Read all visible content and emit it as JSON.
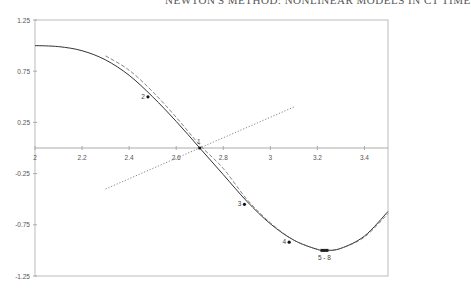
{
  "header": {
    "text": "NEWTON'S METHOD: NONLINEAR MODELS IN CT TIME"
  },
  "chart_data": {
    "type": "line",
    "title": "",
    "xlabel": "",
    "ylabel": "",
    "xlim": [
      2,
      3.5
    ],
    "ylim": [
      -1.25,
      1.25
    ],
    "grid": false,
    "x_ticks": [
      "2",
      "2.2",
      "2.4",
      "2.6",
      "2.8",
      "3",
      "3.2",
      "3.4"
    ],
    "y_ticks": [
      "1.25",
      "0.75",
      "0.25",
      "-0.25",
      "-0.75",
      "-1.25"
    ],
    "series": [
      {
        "name": "function",
        "style": "solid",
        "x": [
          2.0,
          2.1,
          2.2,
          2.3,
          2.4,
          2.5,
          2.6,
          2.7,
          2.8,
          2.9,
          3.0,
          3.1,
          3.2,
          3.24,
          3.3,
          3.4,
          3.5
        ],
        "y": [
          1.0,
          0.99,
          0.95,
          0.86,
          0.71,
          0.5,
          0.26,
          0.0,
          -0.26,
          -0.52,
          -0.74,
          -0.9,
          -0.99,
          -1.0,
          -0.98,
          -0.86,
          -0.62
        ]
      },
      {
        "name": "approximation",
        "style": "dashed",
        "x": [
          2.3,
          2.4,
          2.5,
          2.6,
          2.7,
          2.8,
          2.9,
          3.0,
          3.1,
          3.2,
          3.24,
          3.3,
          3.4,
          3.5
        ],
        "y": [
          0.9,
          0.76,
          0.55,
          0.3,
          0.03,
          -0.2,
          -0.5,
          -0.73,
          -0.9,
          -0.99,
          -1.0,
          -0.98,
          -0.87,
          -0.64
        ]
      },
      {
        "name": "tangent",
        "style": "dotted",
        "x": [
          2.3,
          3.1
        ],
        "y": [
          -0.4,
          0.4
        ]
      }
    ],
    "annotations": [
      {
        "label": "1",
        "x": 2.7,
        "y": 0.0
      },
      {
        "label": "2",
        "x": 2.48,
        "y": 0.5
      },
      {
        "label": "3",
        "x": 2.89,
        "y": -0.55
      },
      {
        "label": "4",
        "x": 3.08,
        "y": -0.92
      },
      {
        "label": "5 - 8",
        "x": 3.23,
        "y": -1.0
      }
    ]
  }
}
